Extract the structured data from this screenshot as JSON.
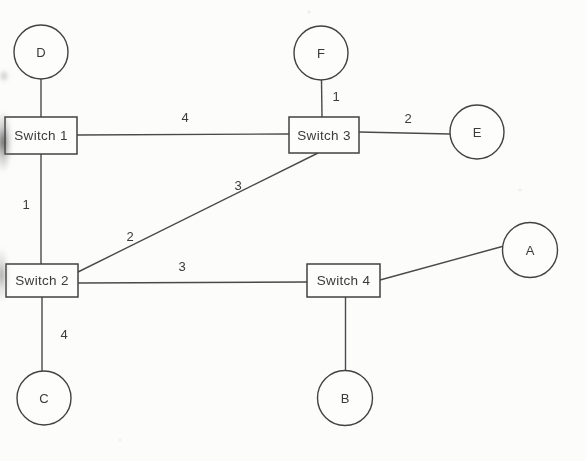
{
  "diagram": {
    "type": "network-topology",
    "colors": {
      "line": "#4a4a4a",
      "node_border": "#424242",
      "node_fill": "#fdfdfc",
      "text": "#3a3a3a",
      "background": "#fcfcfb"
    },
    "hosts": [
      {
        "id": "D",
        "label": "D",
        "cx": 41,
        "cy": 52,
        "r": 27
      },
      {
        "id": "F",
        "label": "F",
        "cx": 321,
        "cy": 53,
        "r": 27
      },
      {
        "id": "E",
        "label": "E",
        "cx": 477,
        "cy": 132,
        "r": 27
      },
      {
        "id": "A",
        "label": "A",
        "cx": 530,
        "cy": 250,
        "r": 27.5
      },
      {
        "id": "B",
        "label": "B",
        "cx": 345,
        "cy": 398,
        "r": 27.5
      },
      {
        "id": "C",
        "label": "C",
        "cx": 44,
        "cy": 398,
        "r": 27
      }
    ],
    "switches": [
      {
        "id": "switch-1",
        "label": "Switch 1",
        "x": 5,
        "y": 117,
        "w": 72,
        "h": 37
      },
      {
        "id": "switch-2",
        "label": "Switch 2",
        "x": 6,
        "y": 264,
        "w": 72,
        "h": 33
      },
      {
        "id": "switch-3",
        "label": "Switch 3",
        "x": 289,
        "y": 117,
        "w": 70,
        "h": 36
      },
      {
        "id": "switch-4",
        "label": "Switch 4",
        "x": 307,
        "y": 264,
        "w": 73,
        "h": 33
      }
    ],
    "links": [
      {
        "from": "D",
        "to": "switch-1",
        "x1": 41,
        "y1": 79,
        "x2": 41,
        "y2": 117,
        "labels": []
      },
      {
        "from": "switch-1",
        "to": "switch-3",
        "x1": 77,
        "y1": 135,
        "x2": 289,
        "y2": 134,
        "labels": [
          {
            "text": "4",
            "x": 185,
            "y": 117
          }
        ]
      },
      {
        "from": "F",
        "to": "switch-3",
        "x1": 321.5,
        "y1": 80,
        "x2": 322,
        "y2": 117,
        "labels": [
          {
            "text": "1",
            "x": 336,
            "y": 96
          }
        ]
      },
      {
        "from": "switch-3",
        "to": "E",
        "x1": 359,
        "y1": 132,
        "x2": 450,
        "y2": 134,
        "labels": [
          {
            "text": "2",
            "x": 408,
            "y": 118
          }
        ]
      },
      {
        "from": "switch-1",
        "to": "switch-2",
        "x1": 41,
        "y1": 154,
        "x2": 41,
        "y2": 264,
        "labels": [
          {
            "text": "1",
            "x": 26,
            "y": 204
          }
        ]
      },
      {
        "from": "switch-2",
        "to": "switch-3",
        "x1": 78,
        "y1": 272,
        "x2": 318,
        "y2": 153,
        "labels": [
          {
            "text": "3",
            "x": 238,
            "y": 185
          },
          {
            "text": "2",
            "x": 130,
            "y": 236
          }
        ]
      },
      {
        "from": "switch-2",
        "to": "switch-4",
        "x1": 78,
        "y1": 283,
        "x2": 307,
        "y2": 282,
        "labels": [
          {
            "text": "3",
            "x": 182,
            "y": 266
          }
        ]
      },
      {
        "from": "switch-2",
        "to": "C",
        "x1": 42,
        "y1": 297,
        "x2": 42,
        "y2": 371,
        "labels": [
          {
            "text": "4",
            "x": 64,
            "y": 334
          }
        ]
      },
      {
        "from": "switch-4",
        "to": "B",
        "x1": 345.5,
        "y1": 297,
        "x2": 345.5,
        "y2": 371,
        "labels": []
      },
      {
        "from": "switch-4",
        "to": "A",
        "x1": 380,
        "y1": 280,
        "x2": 504,
        "y2": 246,
        "labels": []
      }
    ]
  }
}
